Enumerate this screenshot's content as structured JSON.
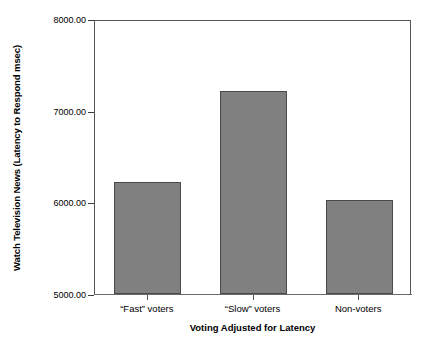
{
  "chart_data": {
    "type": "bar",
    "title": "",
    "subtitle": "",
    "xlabel": "Voting Adjusted for Latency",
    "ylabel": "Watch Television News (Latency to Respond msec)",
    "categories": [
      "“Fast” voters",
      "“Slow” voters",
      "Non-voters"
    ],
    "values": [
      6225.0,
      7210.0,
      6025.0
    ],
    "series": [
      {
        "name": "Watch Television News (Latency to Respond msec)",
        "values": [
          6225.0,
          7210.0,
          6025.0
        ]
      }
    ],
    "ylim": [
      5000.0,
      8000.0
    ],
    "yticks": [
      5000.0,
      6000.0,
      7000.0,
      8000.0
    ],
    "ytick_labels": [
      "5000.00",
      "6000.00",
      "7000.00",
      "8000.00"
    ],
    "grid": false,
    "legend": false,
    "legend_position": "none",
    "bar_color": "#808080",
    "bar_edge_color": "#4a4a4a",
    "frame_color": "#555555",
    "background_color": "#ffffff",
    "text_color": "#000000"
  }
}
